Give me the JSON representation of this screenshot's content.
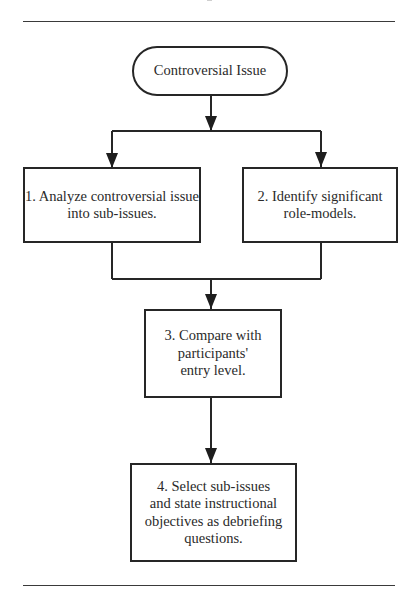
{
  "diagram": {
    "type": "flowchart",
    "start": {
      "label": "Controversial Issue"
    },
    "steps": [
      {
        "id": 1,
        "lines": [
          "1. Analyze controversial issue",
          "into sub-issues."
        ]
      },
      {
        "id": 2,
        "lines": [
          "2. Identify significant",
          "role-models."
        ]
      },
      {
        "id": 3,
        "lines": [
          "3. Compare with",
          "participants'",
          "entry level."
        ]
      },
      {
        "id": 4,
        "lines": [
          "4. Select sub-issues",
          "and state instructional",
          "objectives as debriefing",
          "questions."
        ]
      }
    ],
    "edges": [
      {
        "from": "start",
        "to": 1
      },
      {
        "from": "start",
        "to": 2
      },
      {
        "from": 1,
        "to": 3
      },
      {
        "from": 2,
        "to": 3
      },
      {
        "from": 3,
        "to": 4
      }
    ]
  }
}
